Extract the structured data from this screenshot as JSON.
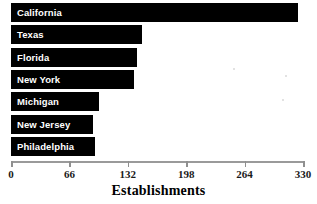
{
  "chart_data": {
    "type": "bar",
    "orientation": "horizontal",
    "title": "",
    "xlabel": "Establishments",
    "ylabel": "",
    "xlim": [
      0,
      330
    ],
    "xticks": [
      0,
      66,
      132,
      198,
      264,
      330
    ],
    "grid": false,
    "legend": null,
    "bar_color": "#000000",
    "label_color": "#ffffff",
    "axis_color": "#9a9a9a",
    "categories": [
      "California",
      "Texas",
      "Florida",
      "New York",
      "Michigan",
      "New Jersey",
      "Philadelphia"
    ],
    "values": [
      324,
      148,
      142,
      139,
      99,
      93,
      95
    ]
  },
  "axis": {
    "title": "Establishments",
    "tick_labels": [
      "0",
      "66",
      "132",
      "198",
      "264",
      "330"
    ]
  },
  "bars": [
    {
      "label": "California",
      "value": 324
    },
    {
      "label": "Texas",
      "value": 148
    },
    {
      "label": "Florida",
      "value": 142
    },
    {
      "label": "New York",
      "value": 139
    },
    {
      "label": "Michigan",
      "value": 99
    },
    {
      "label": "New Jersey",
      "value": 93
    },
    {
      "label": "Philadelphia",
      "value": 95
    }
  ]
}
